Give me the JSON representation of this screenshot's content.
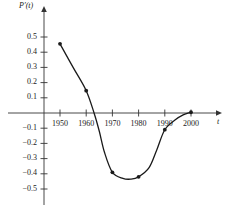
{
  "chart_data": {
    "type": "line",
    "title": "",
    "subtitle": "",
    "xlabel": "t",
    "ylabel": "P'(t)",
    "ylabel_parts": {
      "base": "P",
      "prime": "′",
      "arg": "(t)"
    },
    "xlim": [
      1945,
      2005
    ],
    "ylim": [
      -0.55,
      0.55
    ],
    "grid": false,
    "legend": null,
    "x_ticks": [
      1950,
      1960,
      1970,
      1980,
      1990,
      2000
    ],
    "x_tick_labels": [
      "1950",
      "1960",
      "1970",
      "1980",
      "1990",
      "2000"
    ],
    "y_ticks": [
      0.5,
      0.4,
      0.3,
      0.2,
      0.1,
      -0.1,
      -0.2,
      -0.3,
      -0.4,
      -0.5
    ],
    "y_tick_labels": [
      "0.5",
      "0.4",
      "0.3",
      "0.2",
      "0.1",
      "−0.1",
      "−0.2",
      "−0.3",
      "−0.4",
      "−0.5"
    ],
    "series": [
      {
        "name": "P'(t)",
        "marker": "filled-circle",
        "color": "#1a1a1a",
        "x": [
          1950,
          1960,
          1970,
          1980,
          1990,
          2000
        ],
        "values": [
          0.455,
          0.147,
          -0.39,
          -0.42,
          -0.11,
          0.005
        ]
      }
    ],
    "zero_crossing_x": 1963,
    "curve_path_points": [
      [
        1950,
        0.455
      ],
      [
        1955,
        0.3
      ],
      [
        1960,
        0.147
      ],
      [
        1963,
        0.0
      ],
      [
        1965,
        -0.12
      ],
      [
        1967,
        -0.26
      ],
      [
        1970,
        -0.39
      ],
      [
        1974,
        -0.43
      ],
      [
        1977,
        -0.435
      ],
      [
        1980,
        -0.42
      ],
      [
        1984,
        -0.36
      ],
      [
        1987,
        -0.24
      ],
      [
        1990,
        -0.11
      ],
      [
        1994,
        -0.045
      ],
      [
        1997,
        -0.012
      ],
      [
        2000,
        0.005
      ]
    ]
  },
  "axes": {
    "x_axis_name": "t",
    "y_axis_name": "P′(t)"
  }
}
